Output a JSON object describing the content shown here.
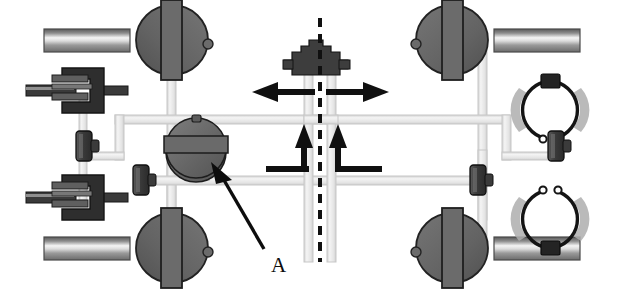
{
  "diagram": {
    "background_color": "#ffffff",
    "width": 625,
    "height": 298,
    "callouts": [
      {
        "id": "A",
        "label": "A",
        "label_x": 271,
        "label_y": 265,
        "leader_from_x": 264,
        "leader_from_y": 249,
        "leader_to_x": 213,
        "leader_to_y": 167,
        "points_to": "central-dome-valve"
      }
    ],
    "centerline": {
      "name": "vehicle-centerline",
      "x": 320,
      "y_top": 18,
      "y_bottom": 262,
      "style": "dashed",
      "color": "#101010",
      "dash": "9 7",
      "width": 4
    },
    "colors": {
      "pipe_fill": "#ededed",
      "pipe_edge": "#c9c9c9",
      "metal_dark": "#4f4f4f",
      "metal_mid": "#6e6e6e",
      "metal_light": "#9a9a9a",
      "shadow": "#b8b8b8",
      "ink": "#101010",
      "outline": "#1a1a1a",
      "shaft_highlight": "#f2f2f2"
    },
    "components": [
      {
        "name": "wheel-hub-front-left",
        "type": "wheel-and-axle",
        "position": "top-left",
        "cx": 172,
        "cy": 40,
        "shaft_side": "left"
      },
      {
        "name": "wheel-hub-rear-left",
        "type": "wheel-and-axle",
        "position": "bottom-left",
        "cx": 172,
        "cy": 248,
        "shaft_side": "left"
      },
      {
        "name": "wheel-hub-front-right",
        "type": "wheel-and-axle",
        "position": "top-right",
        "cx": 452,
        "cy": 40,
        "shaft_side": "right"
      },
      {
        "name": "wheel-hub-rear-right",
        "type": "wheel-and-axle",
        "position": "bottom-right",
        "cx": 452,
        "cy": 248,
        "shaft_side": "right"
      },
      {
        "name": "disc-brake-caliper-upper-left",
        "type": "disc-brake-caliper",
        "cx": 78,
        "cy": 90
      },
      {
        "name": "disc-brake-caliper-lower-left",
        "type": "disc-brake-caliper",
        "cx": 78,
        "cy": 197
      },
      {
        "name": "drum-brake-shoes-upper-right",
        "type": "drum-brake-shoe-assembly",
        "cx": 548,
        "cy": 113,
        "orientation": "up"
      },
      {
        "name": "drum-brake-shoes-lower-right",
        "type": "drum-brake-shoe-assembly",
        "cx": 548,
        "cy": 219,
        "orientation": "down"
      },
      {
        "name": "master-cylinder-block",
        "type": "master-cylinder",
        "cx": 316,
        "cy": 58
      },
      {
        "name": "central-dome-valve",
        "type": "pressure-modulator-dome",
        "cx": 196,
        "cy": 143,
        "callout": "A"
      },
      {
        "name": "wheel-cylinder-left-upper",
        "type": "inline-valve",
        "cx": 84,
        "cy": 146
      },
      {
        "name": "wheel-cylinder-left-lower",
        "type": "inline-valve",
        "cx": 140,
        "cy": 180
      },
      {
        "name": "wheel-cylinder-right-lower",
        "type": "inline-valve",
        "cx": 475,
        "cy": 180
      },
      {
        "name": "wheel-cylinder-right-middle",
        "type": "inline-valve",
        "cx": 562,
        "cy": 143
      }
    ],
    "flow_arrows": [
      {
        "name": "flow-arrow-left-outbound",
        "direction": "left",
        "x": 255,
        "y": 92,
        "length": 60,
        "color": "#101010"
      },
      {
        "name": "flow-arrow-right-outbound",
        "direction": "right",
        "x": 355,
        "y": 92,
        "length": 60,
        "color": "#101010"
      },
      {
        "name": "flow-arrow-return-left",
        "direction": "up",
        "x": 304,
        "y": 130,
        "color": "#101010"
      },
      {
        "name": "flow-arrow-return-right",
        "direction": "up",
        "x": 340,
        "y": 130,
        "color": "#101010"
      }
    ],
    "pipe_segments": [
      {
        "name": "pipe-upper-left-circuit"
      },
      {
        "name": "pipe-upper-right-circuit"
      },
      {
        "name": "pipe-lower-cross-circuit"
      },
      {
        "name": "pipe-wheel-drop-front-left"
      },
      {
        "name": "pipe-wheel-drop-rear-left"
      },
      {
        "name": "pipe-wheel-drop-front-right"
      },
      {
        "name": "pipe-wheel-drop-rear-right"
      },
      {
        "name": "pipe-master-cylinder-feed"
      }
    ]
  }
}
